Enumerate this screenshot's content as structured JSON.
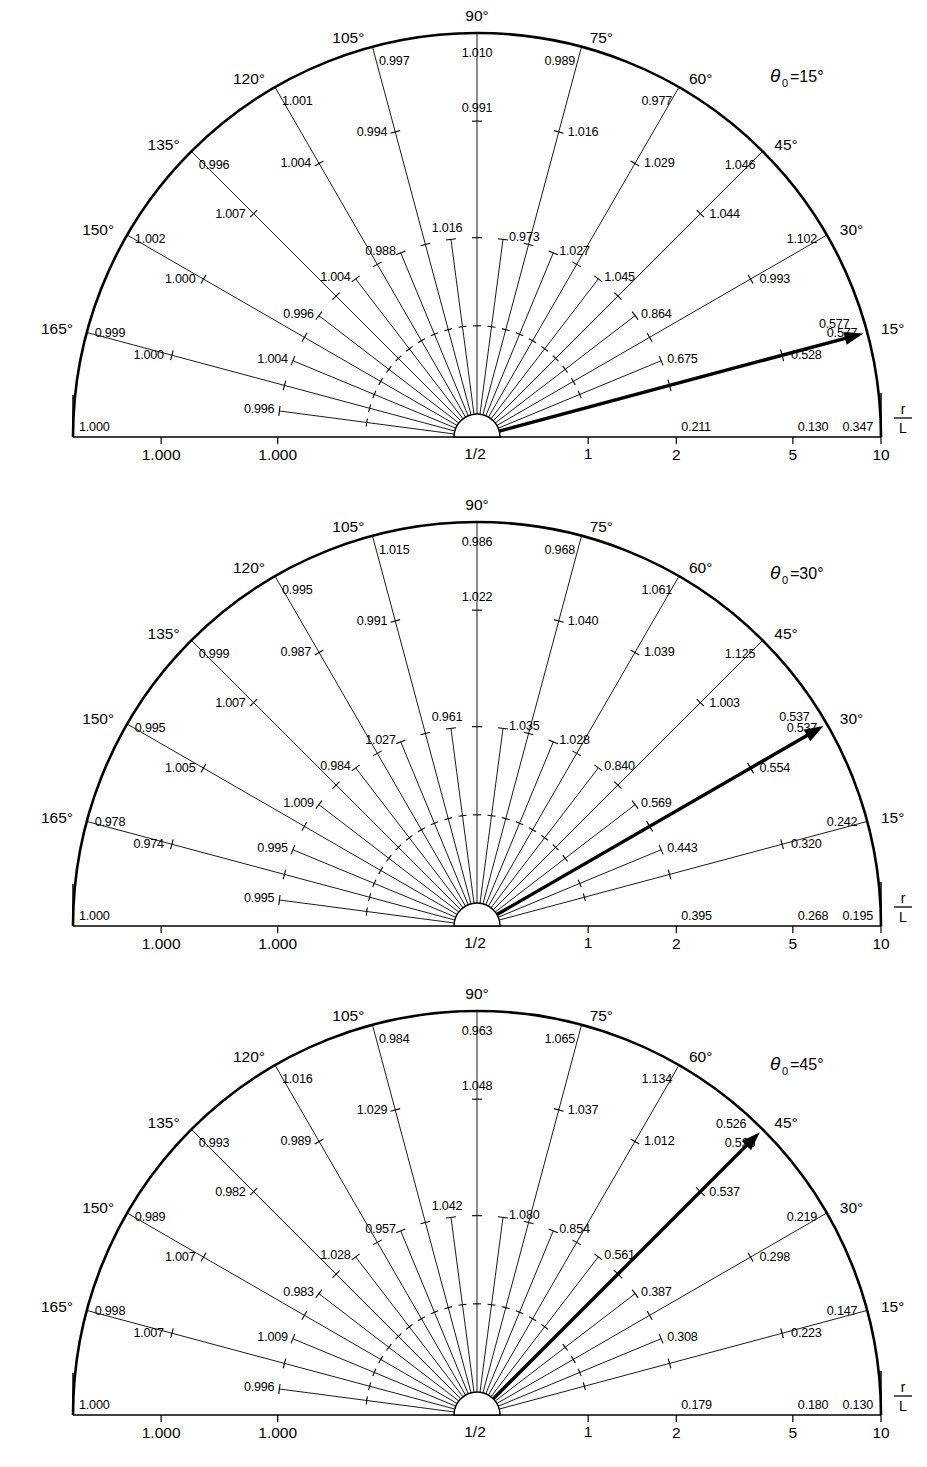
{
  "figure": {
    "type": "polar-value-chart-set",
    "panel_count": 3,
    "radial_axis_label_top": "r",
    "radial_axis_label_bottom": "L",
    "radial_ticks": [
      "1/2",
      "1",
      "2",
      "5",
      "10"
    ],
    "angle_ticks": [
      "165°",
      "150°",
      "135°",
      "120°",
      "105°",
      "90°",
      "75°",
      "60°",
      "45°",
      "30°",
      "15°"
    ],
    "left_axis_ticks": [
      "1.000",
      "1.000"
    ],
    "left_corner_value": "1.000"
  },
  "panels": [
    {
      "id": "panel-theta0-15",
      "theta_label_symbol": "θ",
      "theta_label_sub": "0",
      "theta_label_eq": "=15°",
      "theta0_deg": 15,
      "arrow_label": "0.577",
      "outer_values": {
        "165": "0.999",
        "150": "1.002",
        "135": "0.996",
        "120": "1.001",
        "105": "0.997",
        "90": "1.010",
        "75": "0.989",
        "60": "0.977",
        "45": "1.046",
        "30": "1.102",
        "15": "0.577"
      },
      "mid_values": {
        "165": "1.000",
        "150": "1.000",
        "135": "1.007",
        "120": "1.004",
        "105": "0.994",
        "90": "0.991",
        "75": "1.016",
        "60": "1.029",
        "45": "1.044",
        "30": "0.993",
        "15": "0.528"
      },
      "inner_values": {
        "172.5": "0.996",
        "157.5": "1.004",
        "142.5": "0.996",
        "127.5": "1.004",
        "112.5": "0.988",
        "97.5": "1.016",
        "82.5": "0.973",
        "67.5": "1.027",
        "52.5": "1.045",
        "37.5": "0.864",
        "22.5": "0.675"
      },
      "baseline_values": {
        "left": "1.000",
        "r2": "0.211",
        "r5": "0.130",
        "r10": "0.347"
      }
    },
    {
      "id": "panel-theta0-30",
      "theta_label_symbol": "θ",
      "theta_label_sub": "0",
      "theta_label_eq": "=30°",
      "theta0_deg": 30,
      "arrow_label": "0.537",
      "outer_values": {
        "165": "0.978",
        "150": "0.995",
        "135": "0.999",
        "120": "0.995",
        "105": "1.015",
        "90": "0.986",
        "75": "0.968",
        "60": "1.061",
        "45": "1.125",
        "30": "0.537",
        "15": "0.242"
      },
      "mid_values": {
        "165": "0.974",
        "150": "1.005",
        "135": "1.007",
        "120": "0.987",
        "105": "0.991",
        "90": "1.022",
        "75": "1.040",
        "60": "1.039",
        "45": "1.003",
        "30": "0.554",
        "15": "0.320"
      },
      "inner_values": {
        "172.5": "0.995",
        "157.5": "0.995",
        "142.5": "1.009",
        "127.5": "0.984",
        "112.5": "1.027",
        "97.5": "0.961",
        "82.5": "1.035",
        "67.5": "1.028",
        "52.5": "0.840",
        "37.5": "0.569",
        "22.5": "0.443"
      },
      "baseline_values": {
        "left": "1.000",
        "r2": "0.395",
        "r5": "0.268",
        "r10": "0.195"
      }
    },
    {
      "id": "panel-theta0-45",
      "theta_label_symbol": "θ",
      "theta_label_sub": "0",
      "theta_label_eq": "=45°",
      "theta0_deg": 45,
      "arrow_label": "0.526",
      "outer_values": {
        "165": "0.998",
        "150": "0.989",
        "135": "0.993",
        "120": "1.016",
        "105": "0.984",
        "90": "0.963",
        "75": "1.065",
        "60": "1.134",
        "45": "0.526",
        "30": "0.219",
        "15": "0.147"
      },
      "mid_values": {
        "165": "1.007",
        "150": "1.007",
        "135": "0.982",
        "120": "0.989",
        "105": "1.029",
        "90": "1.048",
        "75": "1.037",
        "60": "1.012",
        "45": "0.537",
        "30": "0.298",
        "15": "0.223"
      },
      "inner_values": {
        "172.5": "0.996",
        "157.5": "1.009",
        "142.5": "0.983",
        "127.5": "1.028",
        "112.5": "0.957",
        "97.5": "1.042",
        "82.5": "1.080",
        "67.5": "0.854",
        "52.5": "0.561",
        "37.5": "0.387",
        "22.5": "0.308"
      },
      "baseline_values": {
        "left": "1.000",
        "r2": "0.179",
        "r5": "0.180",
        "r10": "0.130"
      }
    }
  ],
  "chart_data": {
    "type": "line",
    "title": "",
    "xlabel": "r/L",
    "ylabel": "",
    "grid": false,
    "legend": "none",
    "radial_scale": "log",
    "radial_domain": [
      0.5,
      10
    ],
    "angles_deg": [
      165,
      150,
      135,
      120,
      105,
      90,
      75,
      60,
      45,
      30,
      15
    ],
    "intermediate_angles_deg": [
      172.5,
      157.5,
      142.5,
      127.5,
      112.5,
      97.5,
      82.5,
      67.5,
      52.5,
      37.5,
      22.5
    ],
    "series": [
      {
        "name": "theta0 = 15°, outer (r/L=10)",
        "values": [
          0.999,
          1.002,
          0.996,
          1.001,
          0.997,
          1.01,
          0.989,
          0.977,
          1.046,
          1.102,
          0.577
        ]
      },
      {
        "name": "theta0 = 15°, mid (r/L=5)",
        "values": [
          1.0,
          1.0,
          1.007,
          1.004,
          0.994,
          0.991,
          1.016,
          1.029,
          1.044,
          0.993,
          0.528
        ]
      },
      {
        "name": "theta0 = 15°, inner (r/L=2)",
        "values": [
          0.996,
          1.004,
          0.996,
          1.004,
          0.988,
          1.016,
          0.973,
          1.027,
          1.045,
          0.864,
          0.675
        ]
      },
      {
        "name": "theta0 = 30°, outer (r/L=10)",
        "values": [
          0.978,
          0.995,
          0.999,
          0.995,
          1.015,
          0.986,
          0.968,
          1.061,
          1.125,
          0.537,
          0.242
        ]
      },
      {
        "name": "theta0 = 30°, mid (r/L=5)",
        "values": [
          0.974,
          1.005,
          1.007,
          0.987,
          0.991,
          1.022,
          1.04,
          1.039,
          1.003,
          0.554,
          0.32
        ]
      },
      {
        "name": "theta0 = 30°, inner (r/L=2)",
        "values": [
          0.995,
          0.995,
          1.009,
          0.984,
          1.027,
          0.961,
          1.035,
          1.028,
          0.84,
          0.569,
          0.443
        ]
      },
      {
        "name": "theta0 = 45°, outer (r/L=10)",
        "values": [
          0.998,
          0.989,
          0.993,
          1.016,
          0.984,
          0.963,
          1.065,
          1.134,
          0.526,
          0.219,
          0.147
        ]
      },
      {
        "name": "theta0 = 45°, mid (r/L=5)",
        "values": [
          1.007,
          1.007,
          0.982,
          0.989,
          1.029,
          1.048,
          1.037,
          1.012,
          0.537,
          0.298,
          0.223
        ]
      },
      {
        "name": "theta0 = 45°, inner (r/L=2)",
        "values": [
          0.996,
          1.009,
          0.983,
          1.028,
          0.957,
          1.042,
          1.08,
          0.854,
          0.561,
          0.387,
          0.308
        ]
      }
    ],
    "baseline_series": [
      {
        "name": "theta0 = 15° baseline (theta=0)",
        "x": [
          "left",
          2,
          5,
          10
        ],
        "values": [
          1.0,
          0.211,
          0.13,
          0.347
        ]
      },
      {
        "name": "theta0 = 30° baseline (theta=0)",
        "x": [
          "left",
          2,
          5,
          10
        ],
        "values": [
          1.0,
          0.395,
          0.268,
          0.195
        ]
      },
      {
        "name": "theta0 = 45° baseline (theta=0)",
        "x": [
          "left",
          2,
          5,
          10
        ],
        "values": [
          1.0,
          0.179,
          0.18,
          0.13
        ]
      }
    ],
    "arrow_values": [
      0.577,
      0.537,
      0.526
    ]
  }
}
